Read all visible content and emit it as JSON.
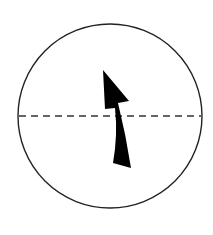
{
  "diagram": {
    "colors": {
      "background": "#ffffff",
      "stroke": "#222222",
      "arrow_fill": "#000000"
    },
    "circle": {
      "cx": 110,
      "cy": 116,
      "r": 92
    },
    "dashed_line": {
      "y": 116,
      "x1": 19,
      "x2": 201,
      "dash": "7,5"
    },
    "arrow": {
      "direction": "curved-up",
      "description": "Black curved arrow pointing upward, crossing the dashed horizontal line"
    }
  }
}
